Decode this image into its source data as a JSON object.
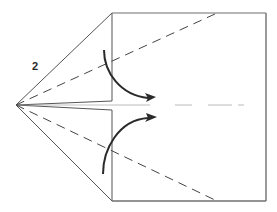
{
  "diagram": {
    "step_number": "2",
    "colors": {
      "paper_edge": "#6f6f6f",
      "fold_line": "#444444",
      "arrow": "#2a2a2a",
      "crease_faint": "#bbbbbb"
    },
    "elements": {
      "square_panel": "Square body of paper",
      "left_point": "Kite point on left",
      "valley_folds": "Dashed valley fold lines",
      "fold_arrows": "Curved arrows showing fold direction"
    }
  }
}
